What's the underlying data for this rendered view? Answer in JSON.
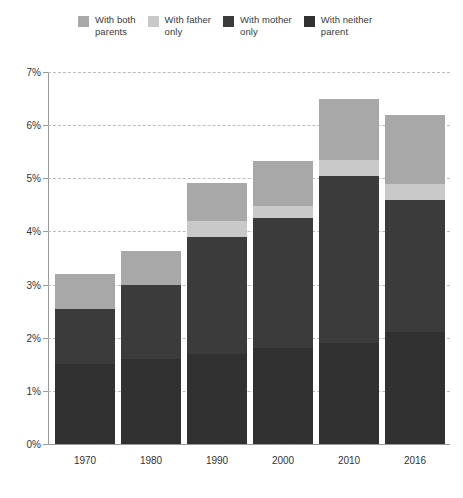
{
  "legend": {
    "position": "top",
    "items": [
      {
        "label": "With both\nparents",
        "key": "both_parents",
        "color": "#a8a8a8"
      },
      {
        "label": "With father\nonly",
        "key": "father_only",
        "color": "#c9c9c9"
      },
      {
        "label": "With mother\nonly",
        "key": "mother_only",
        "color": "#3b3b3b"
      },
      {
        "label": "With neither\nparent",
        "key": "neither_parent",
        "color": "#313131"
      }
    ]
  },
  "axes": {
    "y": {
      "ticks": [
        "0%",
        "1%",
        "2%",
        "3%",
        "4%",
        "5%",
        "6%",
        "7%"
      ],
      "values": [
        0,
        1,
        2,
        3,
        4,
        5,
        6,
        7
      ],
      "min": 0,
      "max": 7,
      "grid": true
    },
    "x": {
      "ticks": [
        "1970",
        "1980",
        "1990",
        "2000",
        "2010",
        "2016"
      ]
    }
  },
  "chart_data": {
    "type": "bar",
    "stacked": true,
    "title": "",
    "subtitle": "",
    "xlabel": "",
    "ylabel": "",
    "ylim": [
      0,
      7
    ],
    "yunit": "%",
    "grid": true,
    "legend_position": "top",
    "categories": [
      "1970",
      "1980",
      "1990",
      "2000",
      "2010",
      "2016"
    ],
    "series": [
      {
        "name": "With neither parent",
        "color": "#313131",
        "values": [
          1.5,
          1.6,
          1.7,
          1.8,
          1.9,
          2.1
        ]
      },
      {
        "name": "With mother only",
        "color": "#3b3b3b",
        "values": [
          1.05,
          1.4,
          2.2,
          2.45,
          3.15,
          2.5
        ]
      },
      {
        "name": "With father only",
        "color": "#c9c9c9",
        "values": [
          0.0,
          0.0,
          0.3,
          0.22,
          0.3,
          0.3
        ]
      },
      {
        "name": "With both parents",
        "color": "#a8a8a8",
        "values": [
          0.65,
          0.63,
          0.72,
          0.85,
          1.15,
          1.3
        ]
      }
    ],
    "totals": [
      3.2,
      3.63,
      4.92,
      5.32,
      6.5,
      6.2
    ]
  },
  "colors": {
    "both_parents": "#a8a8a8",
    "father_only": "#c9c9c9",
    "mother_only": "#3b3b3b",
    "neither_parent": "#313131",
    "gridline": "#bdbdbd",
    "axis": "#9a9a9a",
    "text": "#333333",
    "background": "#ffffff"
  }
}
